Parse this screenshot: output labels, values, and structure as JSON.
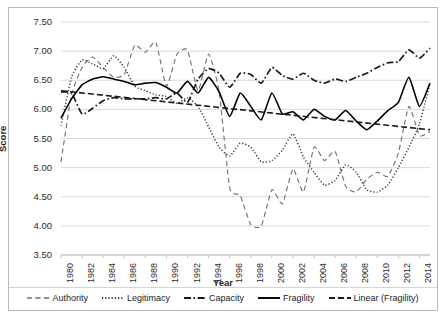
{
  "chart_data": {
    "type": "line",
    "title": "",
    "xlabel": "Year",
    "ylabel": "Score",
    "xlim": [
      1980,
      2015
    ],
    "ylim": [
      3.5,
      7.5
    ],
    "ytick_step": 0.5,
    "xtick_step": 2,
    "grid": true,
    "legend_position": "bottom",
    "ytick_labels": [
      "7.50",
      "7.00",
      "6.50",
      "6.00",
      "5.50",
      "5.00",
      "4.50",
      "4.00",
      "3.50"
    ],
    "ytick_values": [
      7.5,
      7.0,
      6.5,
      6.0,
      5.5,
      5.0,
      4.5,
      4.0,
      3.5
    ],
    "xtick_labels": [
      "1980",
      "1982",
      "1984",
      "1986",
      "1988",
      "1990",
      "1992",
      "1994",
      "1996",
      "1998",
      "2000",
      "2002",
      "2004",
      "2006",
      "2008",
      "2010",
      "2012",
      "2014"
    ],
    "xtick_values": [
      1980,
      1982,
      1984,
      1986,
      1988,
      1990,
      1992,
      1994,
      1996,
      1998,
      2000,
      2002,
      2004,
      2006,
      2008,
      2010,
      2012,
      2014
    ],
    "x": [
      1980,
      1981,
      1982,
      1983,
      1984,
      1985,
      1986,
      1987,
      1988,
      1989,
      1990,
      1991,
      1992,
      1993,
      1994,
      1995,
      1996,
      1997,
      1998,
      1999,
      2000,
      2001,
      2002,
      2003,
      2004,
      2005,
      2006,
      2007,
      2008,
      2009,
      2010,
      2011,
      2012,
      2013,
      2014,
      2015
    ],
    "series": [
      {
        "name": "Authority",
        "style": "dashed",
        "color": "#6e6e6e",
        "values": [
          5.1,
          6.25,
          6.72,
          6.9,
          6.72,
          6.55,
          6.6,
          7.1,
          6.98,
          7.15,
          6.4,
          6.95,
          7.02,
          6.32,
          6.95,
          6.3,
          4.65,
          4.52,
          4.02,
          4.0,
          4.62,
          4.38,
          4.98,
          4.58,
          5.35,
          5.12,
          5.28,
          4.68,
          4.58,
          4.8,
          4.92,
          4.85,
          5.25,
          6.05,
          5.55,
          5.62
        ]
      },
      {
        "name": "Legitimacy",
        "style": "dotted",
        "color": "#3a3a3a",
        "values": [
          5.72,
          6.55,
          6.85,
          6.78,
          6.7,
          6.92,
          6.72,
          6.4,
          6.32,
          6.25,
          6.22,
          6.1,
          6.2,
          6.05,
          5.7,
          5.35,
          5.2,
          5.42,
          5.35,
          5.1,
          5.12,
          5.3,
          5.58,
          5.18,
          4.92,
          4.7,
          4.78,
          5.05,
          4.92,
          4.62,
          4.58,
          4.7,
          5.0,
          5.35,
          5.75,
          6.45
        ]
      },
      {
        "name": "Capacity",
        "style": "dashdot",
        "color": "#1a1a1a",
        "values": [
          6.3,
          6.28,
          5.92,
          6.02,
          6.15,
          6.2,
          6.18,
          6.18,
          6.18,
          6.2,
          6.18,
          6.28,
          6.12,
          6.52,
          6.7,
          6.62,
          6.38,
          6.62,
          6.6,
          6.45,
          6.72,
          6.58,
          6.52,
          6.62,
          6.5,
          6.45,
          6.52,
          6.48,
          6.55,
          6.62,
          6.72,
          6.8,
          6.82,
          7.02,
          6.88,
          7.05
        ]
      },
      {
        "name": "Fragility",
        "style": "solid",
        "color": "#000000",
        "values": [
          5.85,
          6.18,
          6.42,
          6.52,
          6.56,
          6.52,
          6.48,
          6.42,
          6.45,
          6.46,
          6.38,
          6.28,
          6.48,
          6.28,
          6.55,
          6.3,
          5.88,
          6.28,
          6.05,
          5.82,
          6.28,
          5.92,
          5.96,
          5.82,
          6.0,
          5.88,
          5.82,
          5.98,
          5.8,
          5.65,
          5.8,
          5.98,
          6.12,
          6.55,
          6.05,
          6.45
        ]
      },
      {
        "name": "Linear (Fragility)",
        "style": "dashed-trend",
        "color": "#1a1a1a",
        "values": [
          6.32,
          6.3,
          6.28,
          6.26,
          6.24,
          6.22,
          6.21,
          6.19,
          6.17,
          6.15,
          6.13,
          6.11,
          6.09,
          6.07,
          6.05,
          6.03,
          6.01,
          5.99,
          5.97,
          5.96,
          5.94,
          5.92,
          5.9,
          5.88,
          5.86,
          5.84,
          5.82,
          5.8,
          5.78,
          5.76,
          5.74,
          5.73,
          5.71,
          5.69,
          5.67,
          5.65
        ]
      }
    ]
  },
  "legend": {
    "items": [
      {
        "label": "Authority",
        "swatch": "dashed"
      },
      {
        "label": "Legitimacy",
        "swatch": "dotted"
      },
      {
        "label": "Capacity",
        "swatch": "dashdot"
      },
      {
        "label": "Fragility",
        "swatch": "solid"
      },
      {
        "label": "Linear (Fragility)",
        "swatch": "dashed-trend"
      }
    ]
  }
}
